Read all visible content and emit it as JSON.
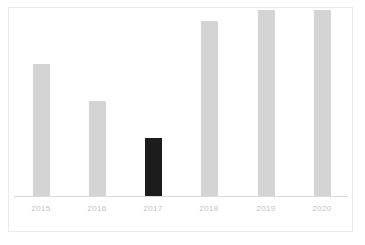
{
  "chart_data": {
    "type": "bar",
    "title": "",
    "subtitle": "",
    "xlabel": "",
    "ylabel": "",
    "categories": [
      "2015",
      "2016",
      "2017",
      "2018",
      "2019",
      "2020"
    ],
    "values": [
      71,
      51,
      31,
      94,
      100,
      100
    ],
    "ylim": [
      0,
      100
    ],
    "grid": false,
    "legend": null,
    "legend_position": "none",
    "tick_labels_y": [],
    "annotations": [],
    "highlight_index": 2,
    "highlight_category": "2017",
    "series": [
      {
        "name": "",
        "values": [
          71,
          51,
          31,
          94,
          100,
          100
        ]
      }
    ],
    "bar_colors": [
      "#d4d4d4",
      "#d4d4d4",
      "#1c1c1c",
      "#d4d4d4",
      "#d4d4d4",
      "#d4d4d4"
    ]
  },
  "style": {
    "bar_color": "#d4d4d4",
    "highlight_color": "#1c1c1c",
    "axis_color": "#d9d9d9",
    "label_color": "#bfbfbf",
    "frame_color": "#e9e9e9",
    "background": "#ffffff"
  }
}
